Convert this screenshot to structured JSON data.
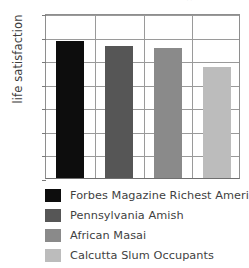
{
  "top_artifact": "··",
  "chart_data": {
    "type": "bar",
    "title": "",
    "xlabel": "",
    "ylabel": "life satisfaction",
    "ylim": [
      0,
      7
    ],
    "yticks": [
      0,
      1,
      2,
      3,
      4,
      5,
      6,
      7
    ],
    "ytick_labels": [
      "0",
      "1",
      "2",
      "3",
      "4",
      "5",
      "6",
      "7"
    ],
    "grid": true,
    "legend_position": "below",
    "categories": [
      "Forbes Magazine Richest Americans",
      "Pennsylvania Amish",
      "African Masai",
      "Calcutta Slum Occupants"
    ],
    "values": [
      5.8,
      5.6,
      5.5,
      4.7
    ],
    "colors": [
      "#0d0d0d",
      "#565656",
      "#8a8a8a",
      "#bcbcbc"
    ],
    "series": [
      {
        "name": "life satisfaction",
        "values": [
          5.8,
          5.6,
          5.5,
          4.7
        ]
      }
    ]
  },
  "legend": {
    "items": [
      {
        "label": "Forbes Magazine Richest Americans",
        "color": "#0d0d0d"
      },
      {
        "label": "Pennsylvania Amish",
        "color": "#565656"
      },
      {
        "label": "African Masai",
        "color": "#8a8a8a"
      },
      {
        "label": "Calcutta Slum Occupants",
        "color": "#bcbcbc"
      }
    ]
  }
}
